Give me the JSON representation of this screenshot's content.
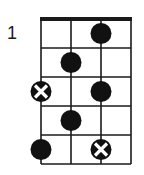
{
  "diagram": {
    "type": "fretboard-scale-diagram",
    "start_fret_label": "1",
    "strings": 4,
    "frets": 5,
    "colors": {
      "line": "#1a1a1a",
      "dot": "#111111",
      "x_mark": "#ffffff",
      "background": "#ffffff"
    },
    "markers": [
      {
        "fret": 1,
        "string": 3,
        "kind": "dot"
      },
      {
        "fret": 2,
        "string": 2,
        "kind": "dot"
      },
      {
        "fret": 3,
        "string": 1,
        "kind": "root-x"
      },
      {
        "fret": 3,
        "string": 3,
        "kind": "dot"
      },
      {
        "fret": 4,
        "string": 2,
        "kind": "dot"
      },
      {
        "fret": 5,
        "string": 1,
        "kind": "dot"
      },
      {
        "fret": 5,
        "string": 3,
        "kind": "root-x"
      }
    ]
  }
}
